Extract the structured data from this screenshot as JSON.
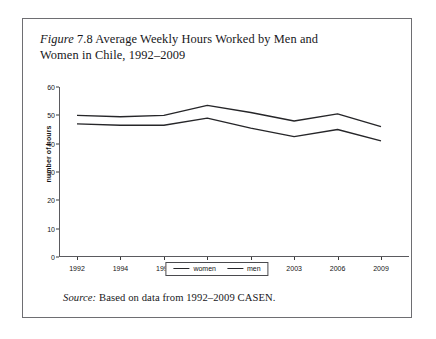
{
  "figure": {
    "label_italic": "Figure",
    "caption": " 7.8 Average Weekly Hours Worked by Men and Women in Chile, 1992–2009",
    "source_italic": "Source:",
    "source_text": " Based on data from 1992–2009 CASEN."
  },
  "chart_data": {
    "type": "line",
    "title": "Figure 7.8 Average Weekly Hours Worked by Men and Women in Chile, 1992–2009",
    "xlabel": "",
    "ylabel": "number of hours",
    "categories": [
      "1992",
      "1994",
      "1996",
      "1998",
      "2000",
      "2003",
      "2006",
      "2009"
    ],
    "series": [
      {
        "name": "men",
        "values": [
          50,
          49.5,
          50,
          53.5,
          51,
          48,
          50.5,
          46
        ]
      },
      {
        "name": "women",
        "values": [
          47,
          46.5,
          46.5,
          49,
          45.5,
          42.5,
          45,
          41
        ]
      }
    ],
    "ylim": [
      0,
      60
    ],
    "yticks": [
      0,
      10,
      20,
      30,
      40,
      50,
      60
    ],
    "grid": false,
    "legend_position": "bottom",
    "line_color": "#262629"
  },
  "legend": {
    "entries": [
      {
        "label": "women"
      },
      {
        "label": "men"
      }
    ]
  }
}
